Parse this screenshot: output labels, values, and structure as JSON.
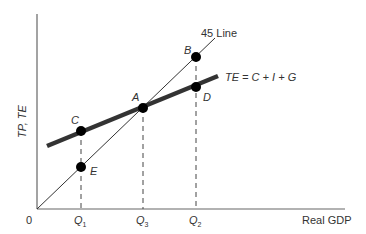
{
  "diagram": {
    "type": "keynesian-cross",
    "y_axis_label": "TP, TE",
    "x_axis_label": "Real GDP",
    "origin_label": "0",
    "line_45_label": "45 Line",
    "te_line_label": "TE = C + I + G",
    "points": {
      "A": "A",
      "B": "B",
      "C": "C",
      "D": "D",
      "E": "E"
    },
    "x_ticks": {
      "q1": "Q",
      "q1_sub": "1",
      "q3": "Q",
      "q3_sub": "3",
      "q2": "Q",
      "q2_sub": "2"
    },
    "colors": {
      "axis": "#555555",
      "line": "#333333",
      "point": "#000000",
      "text": "#333333"
    }
  }
}
